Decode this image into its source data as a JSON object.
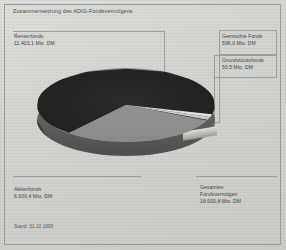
{
  "figure": {
    "title": "Zusammensetzung des ADIG-Fondsvermögens",
    "stand": "Stand: 31.12.1993",
    "frame_color": "#9d9d99",
    "background_color": "#d2d2ce"
  },
  "labels": {
    "rentenfonds": {
      "name": "Rentenfonds",
      "value": "11.403,1 Mio. DM"
    },
    "aktienfonds": {
      "name": "Aktienfonds",
      "value": "6.930,4 Mio. DM"
    },
    "gemischte": {
      "name": "Gemischte Fonds",
      "value": "596,0 Mio. DM"
    },
    "grundstuecks": {
      "name": "Grundstücksfonds",
      "value": "50,5 Mio. DM"
    },
    "gesamt": {
      "name": "Gesamtes",
      "name2": "Fondsvermögen",
      "value": "18.000,8 Mio. DM"
    }
  },
  "chart_data": {
    "type": "pie",
    "title": "Zusammensetzung des ADIG-Fondsvermögens",
    "subtitle": "Stand: 31.12.1993",
    "unit": "Mio. DM",
    "labels": [
      "Rentenfonds",
      "Aktienfonds",
      "Gemischte Fonds",
      "Grundstücksfonds"
    ],
    "values": [
      11403.1,
      6930.4,
      596.0,
      50.5
    ],
    "value_labels": [
      "11.403,1 Mio. DM",
      "6.930,4 Mio. DM",
      "596,0 Mio. DM",
      "50,5 Mio. DM"
    ],
    "percentages": [
      63.3,
      38.5,
      3.3,
      0.3
    ],
    "colors": [
      "#242422",
      "#8f8f8d",
      "#c9c9c5",
      "#e2e2de"
    ],
    "total": 18000.8,
    "total_label": "Gesamtes Fondsvermögen 18.000,8 Mio. DM",
    "legend": "callout-labels",
    "grid": false,
    "three_d": true
  }
}
